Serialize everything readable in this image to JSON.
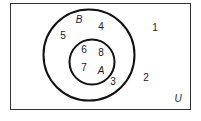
{
  "diagram": {
    "type": "venn",
    "universe": {
      "label": "U",
      "elements_outside": [
        "1",
        "2"
      ]
    },
    "sets": [
      {
        "name": "B",
        "label": "B",
        "elements_only": [
          "3",
          "4",
          "5"
        ]
      },
      {
        "name": "A",
        "label": "A",
        "subset_of": "B",
        "elements": [
          "6",
          "7",
          "8"
        ]
      }
    ],
    "numbers": {
      "n1": "1",
      "n2": "2",
      "n3": "3",
      "n4": "4",
      "n5": "5",
      "n6": "6",
      "n7": "7",
      "n8": "8"
    },
    "colors": {
      "stroke": "#1a1a1a",
      "background": "#ffffff"
    }
  }
}
